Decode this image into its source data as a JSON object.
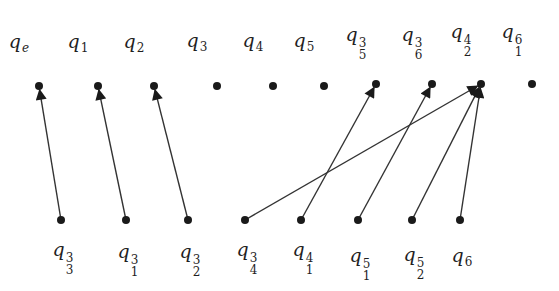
{
  "diagram": {
    "type": "bipartite-directed-graph",
    "colors": {
      "ink": "#1a1a1a",
      "edge": "#333333",
      "background": "#ffffff"
    },
    "top_row": [
      {
        "id": "qe",
        "base": "q",
        "sub": "e",
        "sup": "",
        "x": 39,
        "y": 86,
        "label_y": 32
      },
      {
        "id": "q1",
        "base": "q",
        "sub": "1",
        "sup": "",
        "x": 98,
        "y": 86,
        "label_y": 32
      },
      {
        "id": "q2",
        "base": "q",
        "sub": "2",
        "sup": "",
        "x": 154,
        "y": 86,
        "label_y": 32
      },
      {
        "id": "q3",
        "base": "q",
        "sub": "3",
        "sup": "",
        "x": 217,
        "y": 86,
        "label_y": 31
      },
      {
        "id": "q4",
        "base": "q",
        "sub": "4",
        "sup": "",
        "x": 273,
        "y": 86,
        "label_y": 31
      },
      {
        "id": "q5",
        "base": "q",
        "sub": "5",
        "sup": "",
        "x": 324,
        "y": 86,
        "label_y": 31
      },
      {
        "id": "q5_3",
        "base": "q",
        "sub": "5",
        "sup": "3",
        "x": 376,
        "y": 84,
        "label_y": 25
      },
      {
        "id": "q6_3",
        "base": "q",
        "sub": "6",
        "sup": "3",
        "x": 432,
        "y": 84,
        "label_y": 25
      },
      {
        "id": "q2_4",
        "base": "q",
        "sub": "2",
        "sup": "4",
        "x": 481,
        "y": 84,
        "label_y": 22
      },
      {
        "id": "q1_6",
        "base": "q",
        "sub": "1",
        "sup": "6",
        "x": 532,
        "y": 84,
        "label_y": 22
      }
    ],
    "bottom_row": [
      {
        "id": "q3_3",
        "base": "q",
        "sub": "3",
        "sup": "3",
        "x": 61,
        "y": 220,
        "label_y": 240
      },
      {
        "id": "q1_3",
        "base": "q",
        "sub": "1",
        "sup": "3",
        "x": 126,
        "y": 220,
        "label_y": 242
      },
      {
        "id": "q2_3",
        "base": "q",
        "sub": "2",
        "sup": "3",
        "x": 188,
        "y": 220,
        "label_y": 242
      },
      {
        "id": "q4_3",
        "base": "q",
        "sub": "4",
        "sup": "3",
        "x": 245,
        "y": 220,
        "label_y": 240
      },
      {
        "id": "q1_4",
        "base": "q",
        "sub": "1",
        "sup": "4",
        "x": 301,
        "y": 220,
        "label_y": 240
      },
      {
        "id": "q1_5",
        "base": "q",
        "sub": "1",
        "sup": "5",
        "x": 358,
        "y": 220,
        "label_y": 246
      },
      {
        "id": "q2_5",
        "base": "q",
        "sub": "2",
        "sup": "5",
        "x": 412,
        "y": 220,
        "label_y": 245
      },
      {
        "id": "q6",
        "base": "q",
        "sub": "6",
        "sup": "",
        "x": 460,
        "y": 220,
        "label_y": 246
      }
    ],
    "edges": [
      {
        "from": "q3_3",
        "to": "qe"
      },
      {
        "from": "q1_3",
        "to": "q1"
      },
      {
        "from": "q2_3",
        "to": "q2"
      },
      {
        "from": "q4_3",
        "to": "q2_4"
      },
      {
        "from": "q1_4",
        "to": "q5_3"
      },
      {
        "from": "q1_5",
        "to": "q6_3"
      },
      {
        "from": "q2_5",
        "to": "q2_4"
      },
      {
        "from": "q6",
        "to": "q2_4"
      }
    ]
  }
}
